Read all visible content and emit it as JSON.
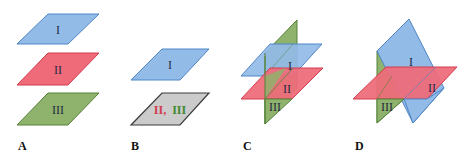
{
  "colors": {
    "plane_I_fill": "#93bbe8",
    "plane_I_stroke": "#4f86c6",
    "plane_II_fill": "#ef6b79",
    "plane_II_stroke": "#d23d4e",
    "plane_III_fill": "#8fb26c",
    "plane_III_stroke": "#55833a",
    "coincident_fill": "#cbcbcb",
    "coincident_stroke": "#3a3a3a",
    "label_red": "#d23d4e",
    "label_green": "#3f8a2e"
  },
  "panels": [
    {
      "letter": "A",
      "description": "Three parallel planes",
      "planes": [
        {
          "label": "I"
        },
        {
          "label": "II"
        },
        {
          "label": "III"
        }
      ]
    },
    {
      "letter": "B",
      "description": "Plane I parallel to coincident planes II and III",
      "planes": [
        {
          "label": "I"
        },
        {
          "label_part1": "II,",
          "label_part2": "III"
        }
      ]
    },
    {
      "letter": "C",
      "description": "Two parallel planes cut by a third plane",
      "planes": [
        {
          "label": "I"
        },
        {
          "label": "II"
        },
        {
          "label": "III"
        }
      ]
    },
    {
      "letter": "D",
      "description": "Three planes intersecting in a single point",
      "planes": [
        {
          "label": "I"
        },
        {
          "label": "II"
        },
        {
          "label": "III"
        }
      ]
    }
  ]
}
